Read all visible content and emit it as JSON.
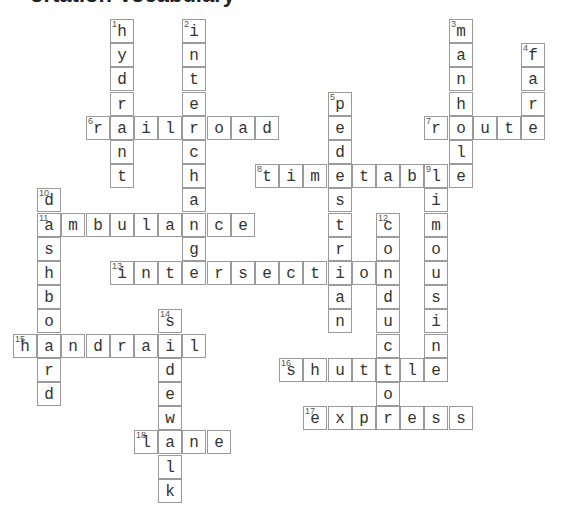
{
  "title_fragment": "ortation Vocabulary",
  "grid": {
    "origin_x": 13,
    "origin_y": 19,
    "cell_size": 24.2
  },
  "words": [
    {
      "number": 1,
      "answer": "hydrant",
      "direction": "down",
      "row": 0,
      "col": 4
    },
    {
      "number": 2,
      "answer": "interchange",
      "direction": "down",
      "row": 0,
      "col": 7
    },
    {
      "number": 3,
      "answer": "manhole",
      "direction": "down",
      "row": 0,
      "col": 18
    },
    {
      "number": 4,
      "answer": "fare",
      "direction": "down",
      "row": 1,
      "col": 21
    },
    {
      "number": 5,
      "answer": "pedestrian",
      "direction": "down",
      "row": 3,
      "col": 13
    },
    {
      "number": 6,
      "answer": "railroad",
      "direction": "across",
      "row": 4,
      "col": 3
    },
    {
      "number": 7,
      "answer": "route",
      "direction": "across",
      "row": 4,
      "col": 17
    },
    {
      "number": 8,
      "answer": "timetable",
      "direction": "across",
      "row": 6,
      "col": 10
    },
    {
      "number": 9,
      "answer": "limousine",
      "direction": "down",
      "row": 6,
      "col": 17
    },
    {
      "number": 10,
      "answer": "dashboard",
      "direction": "down",
      "row": 7,
      "col": 1
    },
    {
      "number": 11,
      "answer": "ambulance",
      "direction": "across",
      "row": 8,
      "col": 1
    },
    {
      "number": 12,
      "answer": "conductor",
      "direction": "down",
      "row": 8,
      "col": 15
    },
    {
      "number": 13,
      "answer": "intersection",
      "direction": "across",
      "row": 10,
      "col": 4
    },
    {
      "number": 14,
      "answer": "sidewalk",
      "direction": "down",
      "row": 12,
      "col": 6
    },
    {
      "number": 15,
      "answer": "handrail",
      "direction": "across",
      "row": 13,
      "col": 0
    },
    {
      "number": 16,
      "answer": "shuttle",
      "direction": "across",
      "row": 14,
      "col": 11
    },
    {
      "number": 17,
      "answer": "express",
      "direction": "across",
      "row": 16,
      "col": 12
    },
    {
      "number": 18,
      "answer": "lane",
      "direction": "across",
      "row": 17,
      "col": 5
    }
  ]
}
